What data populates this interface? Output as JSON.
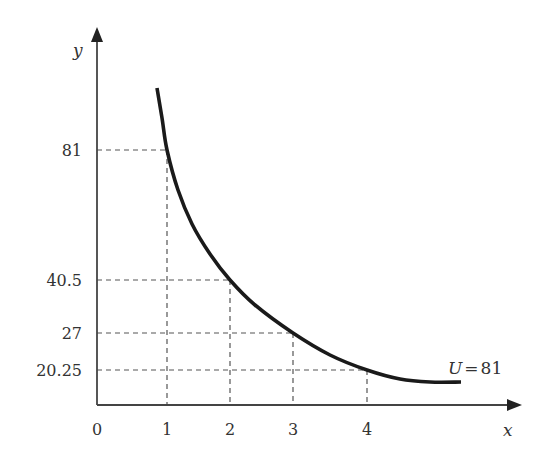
{
  "chart_data": {
    "type": "line",
    "title": "",
    "xlabel": "x",
    "ylabel": "y",
    "origin_label": "0",
    "x_ticks": [
      1,
      2,
      3,
      4
    ],
    "x_tick_labels": [
      "1",
      "2",
      "3",
      "4"
    ],
    "y_ticks": [
      20.25,
      27,
      40.5,
      81
    ],
    "y_tick_labels": [
      "20.25",
      "27",
      "40.5",
      "81"
    ],
    "grid": "dashed guide lines to marked points",
    "series": [
      {
        "name": "U=81",
        "label_prefix": "U",
        "label_eq": "=",
        "label_value": "81",
        "equation": "y = 81 / x",
        "marked_points": [
          {
            "x": 1,
            "y": 81
          },
          {
            "x": 2,
            "y": 40.5
          },
          {
            "x": 3,
            "y": 27
          },
          {
            "x": 4,
            "y": 20.25
          }
        ],
        "x_range": [
          0.85,
          4.9
        ]
      }
    ],
    "colors": {
      "curve": "#1a1a1a",
      "axes": "#444444",
      "guides": "#555555",
      "text": "#333333"
    }
  }
}
